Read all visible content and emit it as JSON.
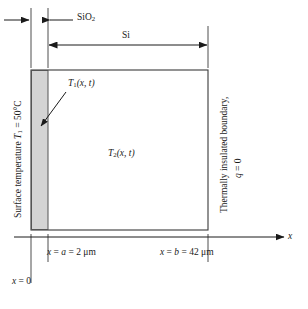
{
  "figure": {
    "type": "heat-conduction-schematic",
    "width": 308,
    "height": 309,
    "background_color": "#ffffff",
    "line_color": "#1a1a1a",
    "shaded_layer_color": "#d4d4d4"
  },
  "dimensions": {
    "sio2": {
      "label": "SiO",
      "subscript": "2",
      "material": "silicon dioxide"
    },
    "si": {
      "label": "Si",
      "material": "silicon"
    }
  },
  "regions": {
    "layer1": {
      "temperature_field": "T",
      "temperature_subscript": "1",
      "argument": "(x, t)"
    },
    "layer2": {
      "temperature_field": "T",
      "temperature_subscript": "2",
      "argument": "(x, t)"
    }
  },
  "boundaries": {
    "left": {
      "text_prefix": "Surface temperature ",
      "symbol": "T",
      "symbol_subscript": "1",
      "equals": " = 50°C"
    },
    "right": {
      "line1": "Thermally insulated boundary,",
      "line2_symbol": "q",
      "line2_value": " = 0"
    }
  },
  "axis": {
    "name": "x",
    "origin_label_symbol": "x",
    "origin_label_value": " = 0",
    "tick_a": {
      "symbol": "x",
      "relation": " = ",
      "param": "a",
      "value": " = 2 ",
      "unit": "μm"
    },
    "tick_b": {
      "symbol": "x",
      "relation": " = ",
      "param": "b",
      "value": " = 42 ",
      "unit": "μm"
    }
  }
}
